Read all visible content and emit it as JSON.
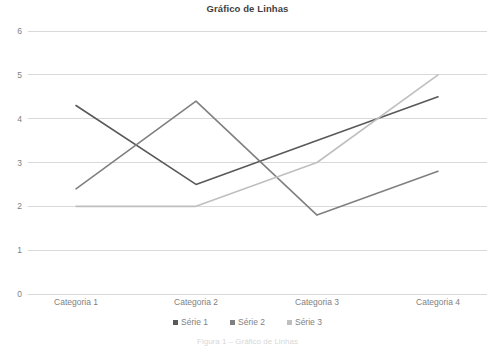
{
  "chart_data": {
    "type": "line",
    "title": "Gráfico de Linhas",
    "xlabel": "",
    "ylabel": "",
    "categories": [
      "Categoria 1",
      "Categoria 2",
      "Categoria 3",
      "Categoria 4"
    ],
    "series": [
      {
        "name": "Série 1",
        "values": [
          4.3,
          2.5,
          3.5,
          4.5
        ],
        "color": "#595959"
      },
      {
        "name": "Série 2",
        "values": [
          2.4,
          4.4,
          1.8,
          2.8
        ],
        "color": "#808080"
      },
      {
        "name": "Série 3",
        "values": [
          2.0,
          2.0,
          3.0,
          5.0
        ],
        "color": "#bfbfbf"
      }
    ],
    "ylim": [
      0,
      6
    ],
    "yticks": [
      0,
      1,
      2,
      3,
      4,
      5,
      6
    ],
    "ytick_labels": [
      "0",
      "1",
      "2",
      "3",
      "4",
      "5",
      "6"
    ],
    "grid": true,
    "grid_axis": "y",
    "grid_color": "#d9d9d9",
    "legend_position": "bottom",
    "background": "#ffffff"
  },
  "caption": "Figura 1 – Gráfico de Linhas"
}
